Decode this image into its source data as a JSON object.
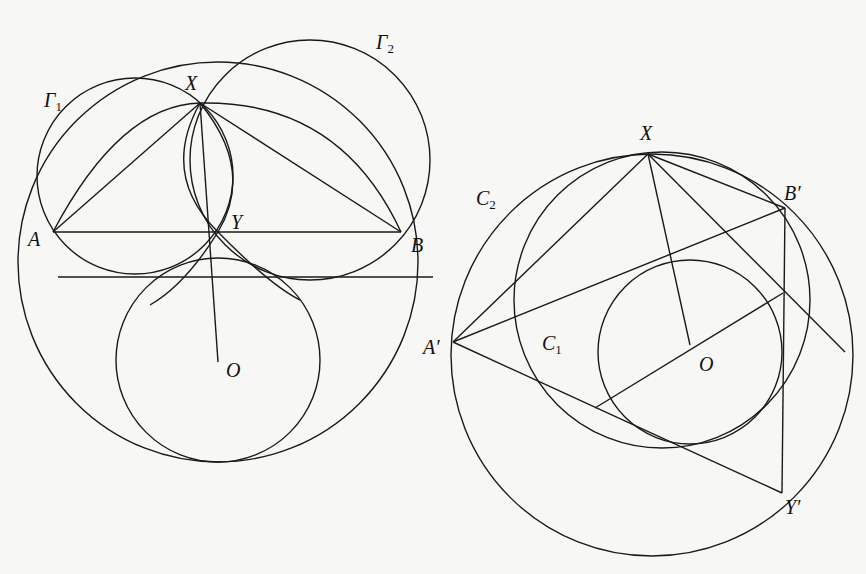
{
  "figures": [
    {
      "name": "left-figure",
      "labels": {
        "gamma1": "Γ",
        "gamma1_sub": "1",
        "gamma2": "Γ",
        "gamma2_sub": "2",
        "X": "X",
        "Y": "Y",
        "A": "A",
        "B": "B",
        "O": "O"
      }
    },
    {
      "name": "right-figure",
      "labels": {
        "X": "X",
        "Bp": "B′",
        "Ap": "A′",
        "Yp": "Y′",
        "O": "O",
        "C1": "C",
        "C1_sub": "1",
        "C2": "C",
        "C2_sub": "2"
      }
    }
  ],
  "colors": {
    "line": "#1a1a1a",
    "background": "#f7f7f5"
  }
}
